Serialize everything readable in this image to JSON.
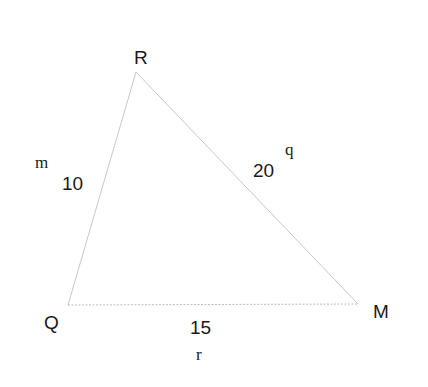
{
  "diagram": {
    "type": "triangle",
    "vertices": {
      "R": {
        "label": "R",
        "x": 136,
        "y": 72
      },
      "Q": {
        "label": "Q",
        "x": 68,
        "y": 305
      },
      "M": {
        "label": "M",
        "x": 358,
        "y": 304
      }
    },
    "sides": {
      "QR": {
        "name": "m",
        "length": "10"
      },
      "RM": {
        "name": "q",
        "length": "20"
      },
      "QM": {
        "name": "r",
        "length": "15"
      }
    },
    "colors": {
      "line": "#c8c8c8",
      "text": "#1a1a1a",
      "background": "#ffffff"
    }
  }
}
